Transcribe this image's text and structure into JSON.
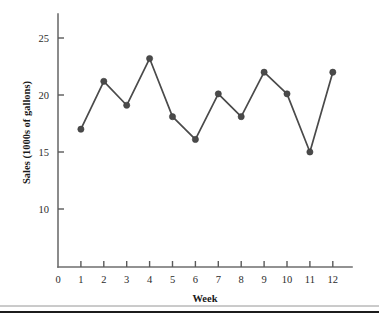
{
  "chart_data": {
    "type": "line",
    "title": "",
    "subtitle": "",
    "xlabel": "Week",
    "ylabel": "Sales (1000s of gallons)",
    "x": [
      1,
      2,
      3,
      4,
      5,
      6,
      7,
      8,
      9,
      10,
      11,
      12
    ],
    "values": [
      17.0,
      21.2,
      19.1,
      23.2,
      18.1,
      16.1,
      20.1,
      18.1,
      22.0,
      20.1,
      15.0,
      22.0
    ],
    "series": [
      {
        "name": "Sales",
        "values": [
          17.0,
          21.2,
          19.1,
          23.2,
          18.1,
          16.1,
          20.1,
          18.1,
          22.0,
          20.1,
          15.0,
          22.0
        ]
      }
    ],
    "xticks": [
      0,
      1,
      2,
      3,
      4,
      5,
      6,
      7,
      8,
      9,
      10,
      11,
      12
    ],
    "xtick_labels": [
      "0",
      "1",
      "2",
      "3",
      "4",
      "5",
      "6",
      "7",
      "8",
      "9",
      "10",
      "11",
      "12"
    ],
    "yticks": [
      10,
      15,
      20,
      25
    ],
    "ytick_labels": [
      "10",
      "15",
      "20",
      "25"
    ],
    "xlim": [
      0,
      12.7
    ],
    "ylim": [
      7.2,
      26.3
    ],
    "grid": false,
    "legend": false,
    "legend_position": "none",
    "marker": "circle",
    "line_color": "#4a4a4a",
    "marker_color": "#4a4a4a",
    "axis_color": "#6e6e6e",
    "background_color": "#ffffff",
    "annotations": []
  },
  "geometry": {
    "plot_left": 58,
    "plot_right": 352,
    "plot_top": 14,
    "plot_bottom": 267,
    "x_unit_px": 22.9,
    "x_origin_px": 58,
    "y_value_25_px": 38,
    "y_px_per_unit": 11.4
  },
  "footer": {
    "rule_label": "page-divider"
  }
}
